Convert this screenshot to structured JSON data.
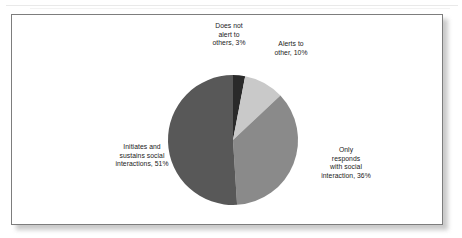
{
  "figure": {
    "background_color": "#ffffff",
    "frame_border_color": "#7d7d7d"
  },
  "chart_data": {
    "type": "pie",
    "title": "",
    "categories": [
      "Does not alert to others",
      "Alerts to other",
      "Only responds with social interaction",
      "Initiates and sustains social interactions"
    ],
    "values": [
      3,
      10,
      36,
      51
    ],
    "value_unit": "%",
    "labels": [
      "Does not\nalert to\nothers, 3%",
      "Alerts to\nother, 10%",
      "Only\nresponds\nwith social\ninteraction, 36%",
      "Initiates and\nsustains social\ninteractions, 51%"
    ],
    "colors": [
      "#2a2a2a",
      "#c9c9c9",
      "#8a8a8a",
      "#585858"
    ],
    "start_angle_deg": 0,
    "direction": "clockwise",
    "legend": false,
    "grid": false,
    "label_placement": "outside"
  },
  "labels": {
    "does_not_alert": "Does not\nalert to\nothers, 3%",
    "alerts_to_other": "Alerts to\nother, 10%",
    "initiates_sustains": "Initiates and\nsustains social\ninteractions, 51%",
    "only_responds": "Only\nresponds\nwith social\ninteraction, 36%"
  }
}
